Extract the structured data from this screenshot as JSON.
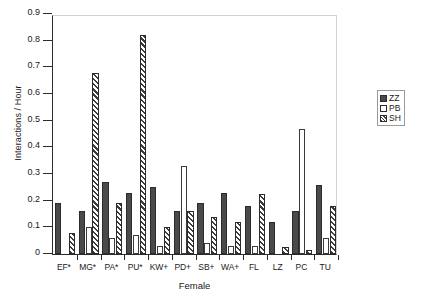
{
  "chart_data": {
    "type": "bar",
    "title": "",
    "xlabel": "Female",
    "ylabel": "Interactions / Hour",
    "ylim": [
      0,
      0.9
    ],
    "yticks": [
      "0",
      "0.1",
      "0.2",
      "0.3",
      "0.4",
      "0.5",
      "0.6",
      "0.7",
      "0.8",
      "0.9"
    ],
    "ytick_values": [
      0,
      0.1,
      0.2,
      0.3,
      0.4,
      0.5,
      0.6,
      0.7,
      0.8,
      0.9
    ],
    "grid": false,
    "legend_position": "right",
    "categories": [
      "EF*",
      "MG*",
      "PA*",
      "PU*",
      "KW+",
      "PD+",
      "SB+",
      "WA+",
      "FL",
      "LZ",
      "PC",
      "TU"
    ],
    "series": [
      {
        "name": "ZZ",
        "style": "filled",
        "color": "#4a4a4a",
        "values": [
          0.19,
          0.16,
          0.27,
          0.23,
          0.25,
          0.16,
          0.19,
          0.23,
          0.18,
          0.12,
          0.16,
          0.26
        ]
      },
      {
        "name": "PB",
        "style": "open",
        "color": "#ffffff",
        "values": [
          0.0,
          0.1,
          0.06,
          0.07,
          0.03,
          0.33,
          0.04,
          0.03,
          0.03,
          0.0,
          0.47,
          0.06
        ]
      },
      {
        "name": "SH",
        "style": "hatched",
        "color": "#3d3d3d",
        "values": [
          0.08,
          0.68,
          0.19,
          0.82,
          0.1,
          0.16,
          0.14,
          0.12,
          0.225,
          0.027,
          0.015,
          0.18
        ]
      }
    ]
  },
  "legend": {
    "items": [
      {
        "label": "ZZ",
        "icon": "filled-square-icon"
      },
      {
        "label": "PB",
        "icon": "open-square-icon"
      },
      {
        "label": "SH",
        "icon": "hatched-square-icon"
      }
    ]
  }
}
